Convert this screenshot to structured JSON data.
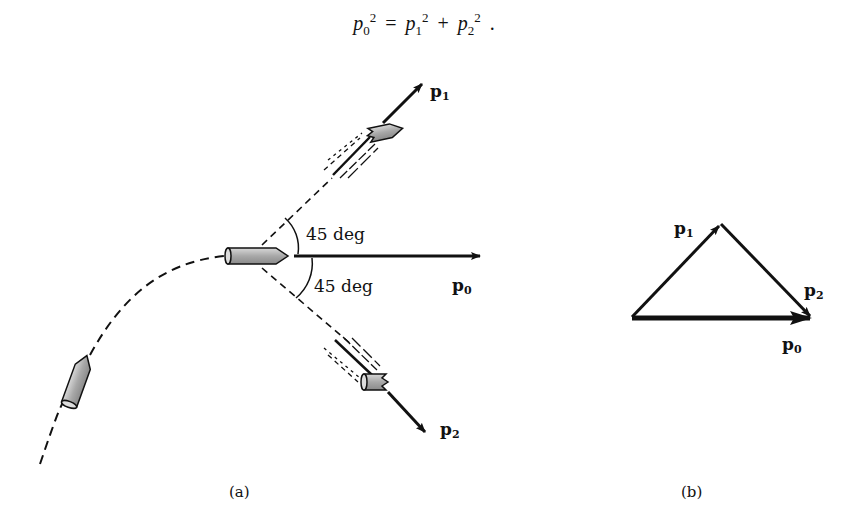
{
  "equation": {
    "p0": "p",
    "p0_sub": "0",
    "p0_sup": "2",
    "equals": "=",
    "p1": "p",
    "p1_sub": "1",
    "p1_sup": "2",
    "plus": "+",
    "p2": "p",
    "p2_sub": "2",
    "p2_sup": "2",
    "period": "."
  },
  "figure_a": {
    "caption": "(a)",
    "vectors": {
      "p0": {
        "base": "p",
        "sub": "0"
      },
      "p1": {
        "base": "p",
        "sub": "1"
      },
      "p2": {
        "base": "p",
        "sub": "2"
      }
    },
    "angle_upper": "45 deg",
    "angle_lower": "45 deg"
  },
  "figure_b": {
    "caption": "(b)",
    "vectors": {
      "p0": {
        "base": "p",
        "sub": "0"
      },
      "p1": {
        "base": "p",
        "sub": "1"
      },
      "p2": {
        "base": "p",
        "sub": "2"
      }
    }
  },
  "colors": {
    "ink": "#111111",
    "shell_fill": "#b8b8b8",
    "background": "#ffffff"
  }
}
